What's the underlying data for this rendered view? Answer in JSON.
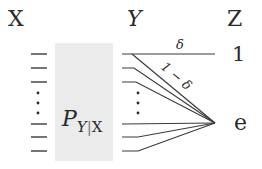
{
  "diagram": {
    "type": "channel-diagram",
    "columns": {
      "x_label": "X",
      "y_label": "Y",
      "z_label": "Z"
    },
    "channel": {
      "label_main": "P",
      "label_sub_left": "Y",
      "label_sub_sep": "|",
      "label_sub_right": "X",
      "fill_color": "#ebebeb"
    },
    "outputs": {
      "top": "1",
      "bottom": "e"
    },
    "edges": {
      "top_edge_label": "δ",
      "diag_edge_label": "1 − δ"
    },
    "input_symbols_visible": 6,
    "output_symbols_visible": 6,
    "ellipsis": "⋮",
    "line_color": "#3a3a3a"
  }
}
